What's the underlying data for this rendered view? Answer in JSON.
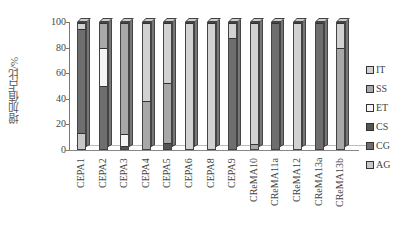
{
  "chart_data": {
    "type": "bar",
    "stacked": true,
    "percent_stacked": true,
    "title": "",
    "xlabel": "",
    "ylabel": "增加值占比/%",
    "ylim": [
      0,
      100
    ],
    "yticks": [
      0,
      20,
      40,
      60,
      80,
      100
    ],
    "legend_position": "right",
    "categories": [
      "CEPA1",
      "CEPA2",
      "CEPA3",
      "CEPA4",
      "CEPA5",
      "CEPA6",
      "CEPA8",
      "CEPA9",
      "CReMA10",
      "CReMA11a",
      "CReMA12",
      "CReMA13a",
      "CReMA13b"
    ],
    "series": [
      {
        "name": "AG",
        "color": "#c8c8c8",
        "values": [
          13,
          0,
          0,
          0,
          0,
          0,
          0,
          0,
          0,
          0,
          0,
          0,
          0
        ]
      },
      {
        "name": "CG",
        "color": "#6e6e6e",
        "values": [
          82,
          50,
          0,
          0,
          0,
          0,
          0,
          88,
          0,
          100,
          0,
          100,
          0
        ]
      },
      {
        "name": "CS",
        "color": "#555555",
        "values": [
          0,
          0,
          2,
          0,
          5,
          0,
          0,
          0,
          0,
          0,
          0,
          0,
          0
        ]
      },
      {
        "name": "ET",
        "color": "#f4f4f4",
        "values": [
          0,
          30,
          10,
          0,
          0,
          0,
          0,
          0,
          0,
          0,
          0,
          0,
          0
        ]
      },
      {
        "name": "SS",
        "color": "#a8a8a8",
        "values": [
          0,
          20,
          88,
          38,
          47,
          0,
          0,
          0,
          4,
          0,
          0,
          0,
          80
        ]
      },
      {
        "name": "IT",
        "color": "#d2d2d2",
        "values": [
          5,
          0,
          0,
          62,
          48,
          100,
          100,
          12,
          96,
          0,
          100,
          0,
          20
        ]
      }
    ]
  },
  "axis": {
    "ylabel": "增加值占比/%",
    "ticks": [
      "0",
      "20",
      "40",
      "60",
      "80",
      "100"
    ]
  },
  "legend": [
    {
      "label": "IT"
    },
    {
      "label": "SS"
    },
    {
      "label": "ET"
    },
    {
      "label": "CS"
    },
    {
      "label": "CG"
    },
    {
      "label": "AG"
    }
  ]
}
